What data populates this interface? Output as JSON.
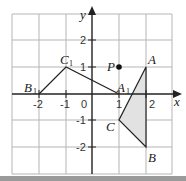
{
  "diagram": {
    "type": "coordinate-grid-transformation",
    "axes": {
      "x_label": "x",
      "y_label": "y",
      "origin_label": "0",
      "x_ticks": [
        "-2",
        "-1",
        "1",
        "2"
      ],
      "y_ticks": [
        "2",
        "1",
        "-1",
        "-2"
      ],
      "x_range": [
        -3,
        3
      ],
      "y_range": [
        -3,
        3
      ]
    },
    "points": {
      "A": {
        "label": "A",
        "x": 2,
        "y": 1
      },
      "B": {
        "label": "B",
        "x": 2,
        "y": -2
      },
      "C": {
        "label": "C",
        "x": 1,
        "y": -1
      },
      "A1": {
        "label": "A",
        "sub": "1",
        "x": 1,
        "y": 0
      },
      "B1": {
        "label": "B",
        "sub": "1",
        "x": -2,
        "y": 0
      },
      "C1": {
        "label": "C",
        "sub": "1",
        "x": -1,
        "y": 1
      },
      "P": {
        "label": "P",
        "x": 1,
        "y": 1
      }
    },
    "shapes": {
      "triangle_ABC": {
        "fill": "#e2e2e2",
        "stroke": "#222222"
      },
      "image_A1B1C1": {
        "fill": "none",
        "stroke": "#222222",
        "drawn_edges": [
          "B1-C1",
          "C1-A1"
        ]
      }
    },
    "colors": {
      "grid": "#b5b5b5",
      "axis": "#222222",
      "point_P": "#111111",
      "bottom_bar": "#9a9a9a"
    }
  }
}
